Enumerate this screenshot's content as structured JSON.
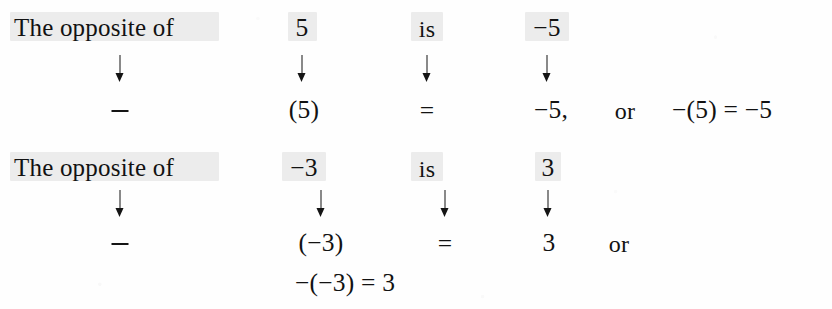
{
  "figure": {
    "kind": "math-notation-worked-example",
    "concept": "The opposite of a number",
    "background_color": "#fefefe",
    "ink_color": "#121212",
    "highlight_color": "#ececec"
  },
  "columns": {
    "statement": "The opposite of",
    "arrow_glyph": "↓",
    "operator_glyph": "−",
    "equals_glyph": "=",
    "connector": "is",
    "alternative": "or"
  },
  "blocks": [
    {
      "id": "opposite-of-5",
      "statement_row": {
        "phrase": "The opposite of",
        "operand": "5",
        "connector": "is",
        "result": "−5"
      },
      "arrow_row": {
        "arrows": [
          "↓",
          "↓",
          "↓",
          "↓"
        ]
      },
      "notation_row": {
        "operator": "−",
        "operand": "(5)",
        "equals": "=",
        "result": "−5,",
        "alternative_label": "or",
        "alternative_equation": "−(5) = −5"
      }
    },
    {
      "id": "opposite-of-negative-3",
      "statement_row": {
        "phrase": "The opposite of",
        "operand": "−3",
        "connector": "is",
        "result": "3"
      },
      "arrow_row": {
        "arrows": [
          "↓",
          "↓",
          "↓",
          "↓"
        ]
      },
      "notation_row": {
        "operator": "−",
        "operand": "(−3)",
        "equals": "=",
        "result": "3",
        "alternative_label": "or"
      },
      "continuation_row": {
        "equation": "−(−3) = 3"
      }
    }
  ]
}
